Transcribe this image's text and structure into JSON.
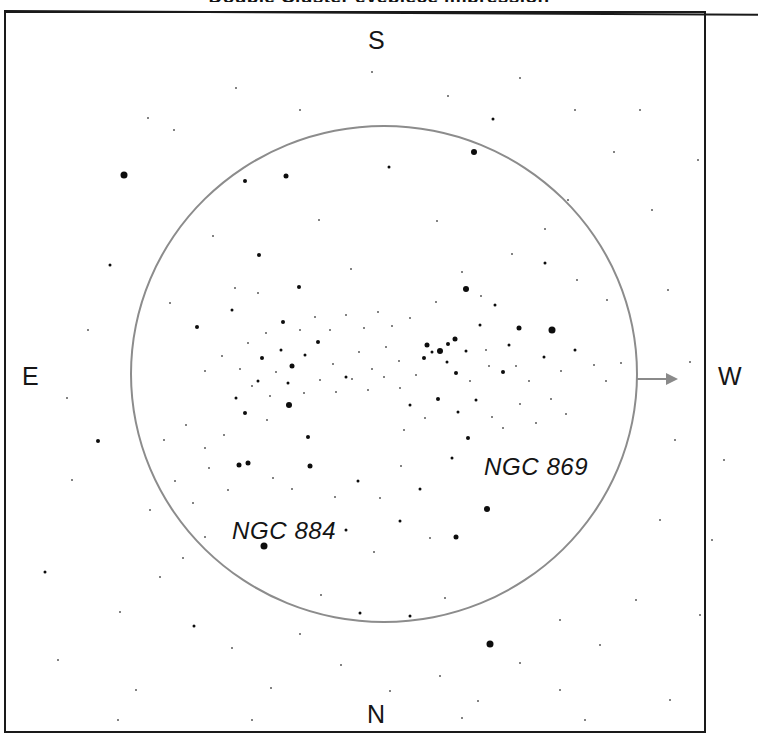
{
  "chart": {
    "title_remnant": "Double Cluster eyepiece impression",
    "background_color": "#ffffff",
    "frame_color": "#1a1a1a",
    "fov_circle_color": "#8c8c8c",
    "star_color": "#0d0d0d"
  },
  "cardinals": {
    "north": "N",
    "south": "S",
    "east": "E",
    "west": "W"
  },
  "labels": {
    "ngc869": "NGC 869",
    "ngc884": "NGC 884"
  },
  "arrow": {
    "name": "drift-direction-arrow",
    "points_to": "W"
  },
  "chart_data": {
    "type": "scatter",
    "title": "Double Cluster eyepiece impression",
    "xlabel": "",
    "ylabel": "",
    "xlim": [
      0,
      758
    ],
    "ylim": [
      0,
      747
    ],
    "grid": false,
    "legend": "none",
    "annotations": [
      {
        "text": "NGC 869",
        "x": 484,
        "y": 453
      },
      {
        "text": "NGC 884",
        "x": 232,
        "y": 517
      },
      {
        "text": "S",
        "x": 368,
        "y": 26
      },
      {
        "text": "N",
        "x": 367,
        "y": 700
      },
      {
        "text": "E",
        "x": 22,
        "y": 362
      },
      {
        "text": "W",
        "x": 718,
        "y": 362
      }
    ],
    "field_of_view_circle": {
      "cx": 384,
      "cy": 374,
      "r": 254
    },
    "series": [
      {
        "name": "stars",
        "points": [
          [
            148,
            118,
            2
          ],
          [
            124,
            175,
            7
          ],
          [
            493,
            119,
            3
          ],
          [
            474,
            152,
            6
          ],
          [
            545,
            229,
            2
          ],
          [
            568,
            200,
            2
          ],
          [
            245,
            181,
            4
          ],
          [
            286,
            176,
            5
          ],
          [
            389,
            167,
            3
          ],
          [
            319,
            220,
            2
          ],
          [
            437,
            221,
            2
          ],
          [
            545,
            263,
            3
          ],
          [
            259,
            255,
            4
          ],
          [
            213,
            236,
            2
          ],
          [
            299,
            287,
            4
          ],
          [
            351,
            269,
            2
          ],
          [
            462,
            272,
            2
          ],
          [
            512,
            254,
            2
          ],
          [
            577,
            280,
            2
          ],
          [
            607,
            300,
            2
          ],
          [
            170,
            303,
            2
          ],
          [
            197,
            327,
            4
          ],
          [
            232,
            310,
            3
          ],
          [
            235,
            288,
            2
          ],
          [
            258,
            293,
            2
          ],
          [
            552,
            330,
            7
          ],
          [
            519,
            328,
            5
          ],
          [
            495,
            305,
            3
          ],
          [
            466,
            289,
            6
          ],
          [
            481,
            296,
            2
          ],
          [
            436,
            302,
            2
          ],
          [
            410,
            318,
            2
          ],
          [
            480,
            325,
            3
          ],
          [
            455,
            339,
            5
          ],
          [
            448,
            344,
            4
          ],
          [
            440,
            351,
            6
          ],
          [
            432,
            352,
            3
          ],
          [
            427,
            345,
            5
          ],
          [
            424,
            358,
            4
          ],
          [
            447,
            362,
            3
          ],
          [
            466,
            351,
            3
          ],
          [
            486,
            350,
            2
          ],
          [
            509,
            345,
            3
          ],
          [
            456,
            373,
            4
          ],
          [
            470,
            381,
            2
          ],
          [
            489,
            366,
            2
          ],
          [
            503,
            372,
            4
          ],
          [
            516,
            366,
            2
          ],
          [
            529,
            381,
            2
          ],
          [
            544,
            357,
            3
          ],
          [
            561,
            371,
            2
          ],
          [
            575,
            350,
            3
          ],
          [
            594,
            365,
            2
          ],
          [
            606,
            381,
            2
          ],
          [
            621,
            363,
            2
          ],
          [
            458,
            412,
            3
          ],
          [
            438,
            399,
            4
          ],
          [
            425,
            418,
            2
          ],
          [
            410,
            405,
            3
          ],
          [
            404,
            430,
            2
          ],
          [
            476,
            400,
            3
          ],
          [
            492,
            417,
            2
          ],
          [
            503,
            428,
            2
          ],
          [
            520,
            404,
            2
          ],
          [
            536,
            423,
            2
          ],
          [
            551,
            399,
            2
          ],
          [
            566,
            414,
            2
          ],
          [
            468,
            438,
            4
          ],
          [
            452,
            458,
            3
          ],
          [
            487,
            509,
            6
          ],
          [
            420,
            489,
            3
          ],
          [
            401,
            466,
            2
          ],
          [
            380,
            498,
            2
          ],
          [
            358,
            481,
            3
          ],
          [
            335,
            497,
            2
          ],
          [
            310,
            466,
            5
          ],
          [
            292,
            489,
            2
          ],
          [
            273,
            478,
            2
          ],
          [
            248,
            463,
            5
          ],
          [
            228,
            490,
            2
          ],
          [
            209,
            468,
            2
          ],
          [
            193,
            503,
            2
          ],
          [
            175,
            481,
            2
          ],
          [
            308,
            437,
            4
          ],
          [
            289,
            405,
            6
          ],
          [
            267,
            420,
            2
          ],
          [
            245,
            413,
            4
          ],
          [
            224,
            435,
            2
          ],
          [
            205,
            448,
            2
          ],
          [
            186,
            425,
            2
          ],
          [
            164,
            440,
            2
          ],
          [
            281,
            350,
            3
          ],
          [
            262,
            358,
            4
          ],
          [
            248,
            343,
            2
          ],
          [
            292,
            366,
            5
          ],
          [
            305,
            355,
            3
          ],
          [
            318,
            342,
            4
          ],
          [
            276,
            372,
            2
          ],
          [
            258,
            381,
            3
          ],
          [
            240,
            369,
            2
          ],
          [
            222,
            356,
            2
          ],
          [
            205,
            371,
            2
          ],
          [
            333,
            364,
            2
          ],
          [
            346,
            377,
            3
          ],
          [
            359,
            352,
            2
          ],
          [
            372,
            369,
            2
          ],
          [
            386,
            347,
            2
          ],
          [
            399,
            361,
            2
          ],
          [
            283,
            322,
            4
          ],
          [
            266,
            333,
            2
          ],
          [
            300,
            330,
            2
          ],
          [
            315,
            317,
            2
          ],
          [
            330,
            330,
            2
          ],
          [
            346,
            315,
            2
          ],
          [
            364,
            328,
            2
          ],
          [
            378,
            312,
            2
          ],
          [
            392,
            326,
            2
          ],
          [
            236,
            398,
            3
          ],
          [
            252,
            386,
            2
          ],
          [
            270,
            396,
            2
          ],
          [
            288,
            383,
            3
          ],
          [
            304,
            393,
            2
          ],
          [
            320,
            380,
            2
          ],
          [
            336,
            392,
            2
          ],
          [
            352,
            379,
            2
          ],
          [
            368,
            390,
            2
          ],
          [
            384,
            377,
            2
          ],
          [
            400,
            388,
            2
          ],
          [
            416,
            375,
            2
          ],
          [
            264,
            546,
            7
          ],
          [
            346,
            530,
            3
          ],
          [
            374,
            552,
            2
          ],
          [
            400,
            521,
            3
          ],
          [
            430,
            538,
            2
          ],
          [
            456,
            537,
            5
          ],
          [
            490,
            644,
            7
          ],
          [
            445,
            598,
            2
          ],
          [
            410,
            616,
            3
          ],
          [
            360,
            613,
            3
          ],
          [
            321,
            595,
            2
          ],
          [
            183,
            558,
            2
          ],
          [
            205,
            537,
            2
          ],
          [
            239,
            465,
            5
          ],
          [
            150,
            510,
            2
          ],
          [
            98,
            441,
            4
          ],
          [
            67,
            398,
            2
          ],
          [
            45,
            572,
            3
          ],
          [
            120,
            612,
            2
          ],
          [
            160,
            577,
            2
          ],
          [
            194,
            626,
            3
          ],
          [
            232,
            648,
            2
          ],
          [
            300,
            634,
            2
          ],
          [
            271,
            688,
            2
          ],
          [
            341,
            665,
            2
          ],
          [
            390,
            691,
            2
          ],
          [
            440,
            676,
            2
          ],
          [
            478,
            701,
            2
          ],
          [
            520,
            663,
            2
          ],
          [
            560,
            690,
            2
          ],
          [
            600,
            645,
            2
          ],
          [
            636,
            600,
            2
          ],
          [
            660,
            520,
            2
          ],
          [
            675,
            440,
            2
          ],
          [
            690,
            362,
            2
          ],
          [
            668,
            290,
            2
          ],
          [
            652,
            210,
            2
          ],
          [
            614,
            152,
            2
          ],
          [
            575,
            110,
            2
          ],
          [
            520,
            78,
            2
          ],
          [
            448,
            96,
            2
          ],
          [
            372,
            72,
            2
          ],
          [
            300,
            110,
            2
          ],
          [
            236,
            88,
            2
          ],
          [
            174,
            130,
            2
          ],
          [
            110,
            265,
            3
          ],
          [
            88,
            330,
            2
          ],
          [
            72,
            480,
            2
          ],
          [
            136,
            690,
            2
          ],
          [
            58,
            660,
            2
          ],
          [
            670,
            700,
            2
          ],
          [
            700,
            615,
            2
          ],
          [
            712,
            540,
            2
          ],
          [
            724,
            460,
            2
          ],
          [
            698,
            160,
            2
          ],
          [
            252,
            720,
            2
          ],
          [
            585,
            720,
            2
          ],
          [
            118,
            720,
            2
          ],
          [
            462,
            718,
            2
          ],
          [
            640,
            110,
            2
          ],
          [
            560,
            620,
            2
          ]
        ]
      }
    ]
  }
}
